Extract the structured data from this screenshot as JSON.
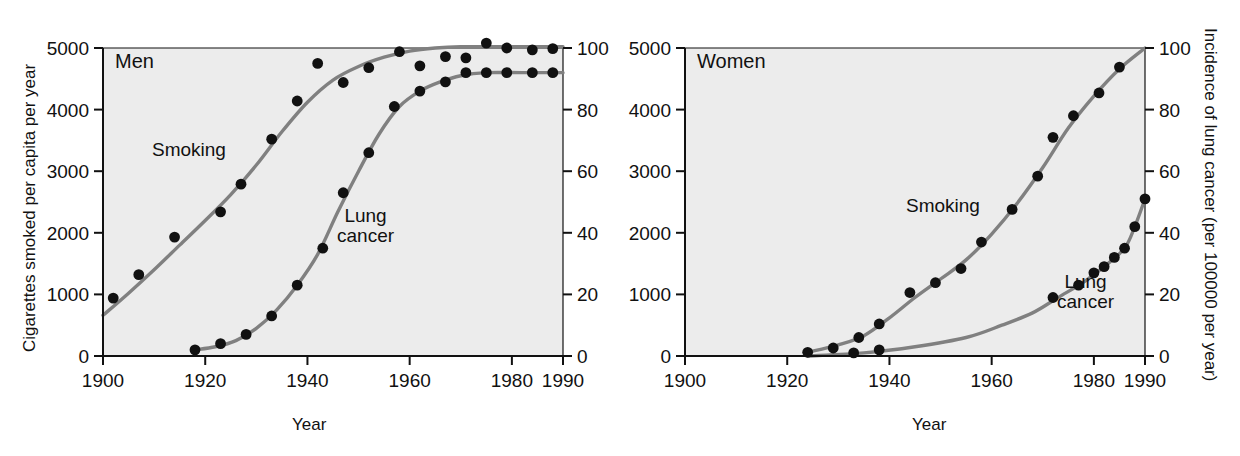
{
  "figure": {
    "background_color": "#ffffff",
    "plot_background_color": "#ececec",
    "curve_color": "#808080",
    "point_color": "#111111",
    "axis_color": "#111111"
  },
  "panels": [
    {
      "id": "men",
      "panel_label": "Men",
      "left_axis_title": "Cigarettes smoked per capita per year",
      "right_axis_title": "",
      "x_axis_title": "Year",
      "smoking_label": "Smoking",
      "cancer_label_line1": "Lung",
      "cancer_label_line2": "cancer",
      "x_ticks": [
        "1900",
        "1920",
        "1940",
        "1960",
        "1980",
        "1990"
      ],
      "left_y_ticks": [
        "0",
        "1000",
        "2000",
        "3000",
        "4000",
        "5000"
      ],
      "right_y_ticks": [
        "0",
        "20",
        "40",
        "60",
        "80",
        "100"
      ]
    },
    {
      "id": "women",
      "panel_label": "Women",
      "left_axis_title": "",
      "right_axis_title": "Incidence of lung cancer (per 100000 per year)",
      "x_axis_title": "Year",
      "smoking_label": "Smoking",
      "cancer_label_line1": "Lung",
      "cancer_label_line2": "cancer",
      "x_ticks": [
        "1900",
        "1920",
        "1940",
        "1960",
        "1980",
        "1990"
      ],
      "left_y_ticks": [
        "0",
        "1000",
        "2000",
        "3000",
        "4000",
        "5000"
      ],
      "right_y_ticks": [
        "0",
        "20",
        "40",
        "60",
        "80",
        "100"
      ]
    }
  ],
  "chart_data": [
    {
      "type": "line",
      "title": "Men",
      "xlabel": "Year",
      "ylabel": "Cigarettes smoked per capita per year",
      "y2label": "Incidence of lung cancer (per 100000 per year)",
      "xlim": [
        1900,
        1990
      ],
      "ylim": [
        0,
        5000
      ],
      "y2lim": [
        0,
        100
      ],
      "xticks": [
        1900,
        1920,
        1940,
        1960,
        1980,
        1990
      ],
      "yticks": [
        0,
        1000,
        2000,
        3000,
        4000,
        5000
      ],
      "y2ticks": [
        0,
        20,
        40,
        60,
        80,
        100
      ],
      "grid": false,
      "legend": "inline-annotations",
      "series": [
        {
          "name": "Smoking",
          "axis": "left",
          "units": "cigarettes per capita per year",
          "points": [
            {
              "x": 1902,
              "y": 940
            },
            {
              "x": 1907,
              "y": 1320
            },
            {
              "x": 1914,
              "y": 1930
            },
            {
              "x": 1923,
              "y": 2340
            },
            {
              "x": 1927,
              "y": 2790
            },
            {
              "x": 1933,
              "y": 3520
            },
            {
              "x": 1938,
              "y": 4140
            },
            {
              "x": 1942,
              "y": 4750
            },
            {
              "x": 1947,
              "y": 4440
            },
            {
              "x": 1952,
              "y": 4680
            },
            {
              "x": 1958,
              "y": 4940
            },
            {
              "x": 1962,
              "y": 4710
            },
            {
              "x": 1967,
              "y": 4860
            },
            {
              "x": 1971,
              "y": 4840
            },
            {
              "x": 1975,
              "y": 5080
            },
            {
              "x": 1979,
              "y": 5000
            },
            {
              "x": 1984,
              "y": 4970
            },
            {
              "x": 1988,
              "y": 4990
            }
          ],
          "fitted_curve": [
            {
              "x": 1900,
              "y": 660
            },
            {
              "x": 1905,
              "y": 1020
            },
            {
              "x": 1910,
              "y": 1400
            },
            {
              "x": 1915,
              "y": 1800
            },
            {
              "x": 1920,
              "y": 2200
            },
            {
              "x": 1925,
              "y": 2620
            },
            {
              "x": 1930,
              "y": 3100
            },
            {
              "x": 1935,
              "y": 3640
            },
            {
              "x": 1940,
              "y": 4120
            },
            {
              "x": 1945,
              "y": 4480
            },
            {
              "x": 1950,
              "y": 4700
            },
            {
              "x": 1955,
              "y": 4850
            },
            {
              "x": 1960,
              "y": 4950
            },
            {
              "x": 1965,
              "y": 5000
            },
            {
              "x": 1970,
              "y": 5020
            },
            {
              "x": 1980,
              "y": 5020
            },
            {
              "x": 1990,
              "y": 5020
            }
          ]
        },
        {
          "name": "Lung cancer",
          "axis": "right",
          "units": "per 100000 per year",
          "points": [
            {
              "x": 1918,
              "y": 2
            },
            {
              "x": 1923,
              "y": 4
            },
            {
              "x": 1928,
              "y": 7
            },
            {
              "x": 1933,
              "y": 13
            },
            {
              "x": 1938,
              "y": 23
            },
            {
              "x": 1943,
              "y": 35
            },
            {
              "x": 1947,
              "y": 53
            },
            {
              "x": 1952,
              "y": 66
            },
            {
              "x": 1957,
              "y": 81
            },
            {
              "x": 1962,
              "y": 86
            },
            {
              "x": 1967,
              "y": 89
            },
            {
              "x": 1971,
              "y": 92
            },
            {
              "x": 1975,
              "y": 92
            },
            {
              "x": 1979,
              "y": 92
            },
            {
              "x": 1984,
              "y": 92
            },
            {
              "x": 1988,
              "y": 92
            }
          ],
          "fitted_curve": [
            {
              "x": 1918,
              "y": 2
            },
            {
              "x": 1922,
              "y": 3
            },
            {
              "x": 1926,
              "y": 5
            },
            {
              "x": 1930,
              "y": 9
            },
            {
              "x": 1934,
              "y": 15
            },
            {
              "x": 1938,
              "y": 23
            },
            {
              "x": 1942,
              "y": 33
            },
            {
              "x": 1946,
              "y": 47
            },
            {
              "x": 1950,
              "y": 60
            },
            {
              "x": 1954,
              "y": 72
            },
            {
              "x": 1958,
              "y": 81
            },
            {
              "x": 1962,
              "y": 86
            },
            {
              "x": 1966,
              "y": 89
            },
            {
              "x": 1970,
              "y": 91
            },
            {
              "x": 1975,
              "y": 92
            },
            {
              "x": 1982,
              "y": 92
            },
            {
              "x": 1990,
              "y": 92
            }
          ]
        }
      ]
    },
    {
      "type": "line",
      "title": "Women",
      "xlabel": "Year",
      "ylabel": "Cigarettes smoked per capita per year",
      "y2label": "Incidence of lung cancer (per 100000 per year)",
      "xlim": [
        1900,
        1990
      ],
      "ylim": [
        0,
        5000
      ],
      "y2lim": [
        0,
        100
      ],
      "xticks": [
        1900,
        1920,
        1940,
        1960,
        1980,
        1990
      ],
      "yticks": [
        0,
        1000,
        2000,
        3000,
        4000,
        5000
      ],
      "y2ticks": [
        0,
        20,
        40,
        60,
        80,
        100
      ],
      "grid": false,
      "legend": "inline-annotations",
      "series": [
        {
          "name": "Smoking",
          "axis": "left",
          "units": "cigarettes per capita per year",
          "points": [
            {
              "x": 1924,
              "y": 60
            },
            {
              "x": 1929,
              "y": 130
            },
            {
              "x": 1934,
              "y": 300
            },
            {
              "x": 1938,
              "y": 520
            },
            {
              "x": 1944,
              "y": 1030
            },
            {
              "x": 1949,
              "y": 1190
            },
            {
              "x": 1954,
              "y": 1420
            },
            {
              "x": 1958,
              "y": 1850
            },
            {
              "x": 1964,
              "y": 2380
            },
            {
              "x": 1969,
              "y": 2920
            },
            {
              "x": 1972,
              "y": 3550
            },
            {
              "x": 1976,
              "y": 3900
            },
            {
              "x": 1981,
              "y": 4270
            },
            {
              "x": 1985,
              "y": 4690
            }
          ],
          "fitted_curve": [
            {
              "x": 1924,
              "y": 60
            },
            {
              "x": 1930,
              "y": 180
            },
            {
              "x": 1935,
              "y": 330
            },
            {
              "x": 1940,
              "y": 620
            },
            {
              "x": 1945,
              "y": 950
            },
            {
              "x": 1950,
              "y": 1250
            },
            {
              "x": 1955,
              "y": 1560
            },
            {
              "x": 1960,
              "y": 1980
            },
            {
              "x": 1965,
              "y": 2480
            },
            {
              "x": 1970,
              "y": 3060
            },
            {
              "x": 1975,
              "y": 3700
            },
            {
              "x": 1980,
              "y": 4220
            },
            {
              "x": 1985,
              "y": 4660
            },
            {
              "x": 1990,
              "y": 5000
            }
          ]
        },
        {
          "name": "Lung cancer",
          "axis": "right",
          "units": "per 100000 per year",
          "points": [
            {
              "x": 1933,
              "y": 1
            },
            {
              "x": 1938,
              "y": 2
            },
            {
              "x": 1972,
              "y": 19
            },
            {
              "x": 1977,
              "y": 23
            },
            {
              "x": 1980,
              "y": 27
            },
            {
              "x": 1982,
              "y": 29
            },
            {
              "x": 1984,
              "y": 32
            },
            {
              "x": 1986,
              "y": 35
            },
            {
              "x": 1988,
              "y": 42
            },
            {
              "x": 1990,
              "y": 51
            }
          ],
          "fitted_curve": [
            {
              "x": 1924,
              "y": 0
            },
            {
              "x": 1935,
              "y": 1
            },
            {
              "x": 1945,
              "y": 3
            },
            {
              "x": 1955,
              "y": 6
            },
            {
              "x": 1962,
              "y": 10
            },
            {
              "x": 1968,
              "y": 14
            },
            {
              "x": 1973,
              "y": 19
            },
            {
              "x": 1978,
              "y": 24
            },
            {
              "x": 1982,
              "y": 29
            },
            {
              "x": 1986,
              "y": 35
            },
            {
              "x": 1988,
              "y": 42
            },
            {
              "x": 1990,
              "y": 51
            }
          ]
        }
      ]
    }
  ]
}
